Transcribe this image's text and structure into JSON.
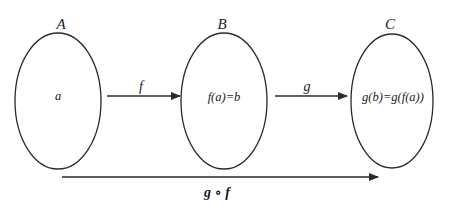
{
  "diagram": {
    "title": "",
    "stroke_color": "#2a2a2a",
    "sets": [
      {
        "id": "A",
        "label": "A",
        "element": "a",
        "cx": 58,
        "cy": 101,
        "rx": 43,
        "ry": 68
      },
      {
        "id": "B",
        "label": "B",
        "element": "f(a)=b",
        "cx": 224,
        "cy": 101,
        "rx": 43,
        "ry": 68
      },
      {
        "id": "C",
        "label": "C",
        "element": "g(b)=g(f(a))",
        "cx": 392,
        "cy": 101,
        "rx": 41,
        "ry": 67
      }
    ],
    "arrows": [
      {
        "id": "f",
        "label": "f",
        "from": "A",
        "to": "B",
        "x1": 107,
        "x2": 180,
        "y": 96
      },
      {
        "id": "g",
        "label": "g",
        "from": "B",
        "to": "C",
        "x1": 275,
        "x2": 347,
        "y": 96
      },
      {
        "id": "gof",
        "label": "g ∘ f",
        "from": "A",
        "to": "C",
        "x1": 62,
        "x2": 378,
        "y": 177
      }
    ]
  }
}
